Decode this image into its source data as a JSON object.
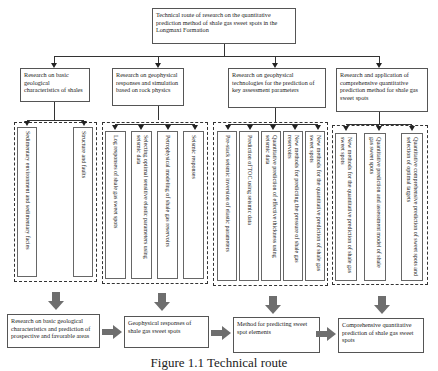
{
  "title": "Technical route of research on the quantitative prediction method of shale gas sweet spots in the Longmaxi Formation",
  "columns": [
    {
      "heading": "Research on basic geological characteristics of shales",
      "items": [
        "Sedimentary environment and sedimentary facies",
        "Structure and faults"
      ],
      "outcome": "Research on basic geological characteristics and prediction of prospective and favorable areas"
    },
    {
      "heading": "Research on geophysical responses and simulation based on rock physics",
      "items": [
        "Log responses of shale gas sweet spots",
        "Selecting optimal sensitive elastic parameters using seismic data",
        "Petrophysical modeling of shale gas reservoirs",
        "Seismic responses"
      ],
      "outcome": "Geophysical responses of shale gas sweet spots"
    },
    {
      "heading": "Research on geophysical technologies for the prediction of key assessment parameters",
      "items": [
        "Pre-stack seismic inversion of elastic parameters",
        "Prediction of TOC using seismic data",
        "Quantitative prediction of effective thickness using seismic data",
        "New methods for predicting the pressure of shale gas reservoirs",
        "New methods for the quantitative prediction of shale gas sweet spots"
      ],
      "outcome": "Method for predicting sweet spot elements"
    },
    {
      "heading": "Research and application of comprehensive quantitative prediction method for shale gas sweet spots",
      "items": [
        "New methods for the quantitative prediction of shale gas sweet spots",
        "Quantitative prediction and assessment model of shale gas sweet spots",
        "Quantitative comprehensive prediction of sweet spots and selection of optimal targets"
      ],
      "outcome": "Comprehensive quantitative prediction of shale gas sweet spots"
    }
  ],
  "caption": "Figure 1.1   Technical route",
  "colors": {
    "fat_arrow": "#6e6e6e",
    "line": "#333333"
  }
}
